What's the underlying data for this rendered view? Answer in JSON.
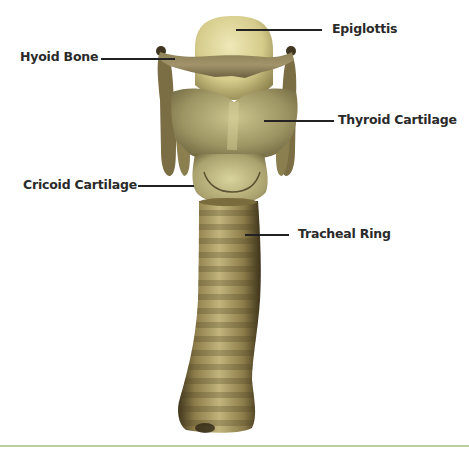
{
  "diagram": {
    "labels": [
      {
        "id": "epiglottis",
        "text": "Epiglottis"
      },
      {
        "id": "hyoid-bone",
        "text": "Hyoid Bone"
      },
      {
        "id": "thyroid-cartilage",
        "text": "Thyroid Cartilage"
      },
      {
        "id": "cricoid-cartilage",
        "text": "Cricoid Cartilage"
      },
      {
        "id": "tracheal-ring",
        "text": "Tracheal Ring"
      }
    ],
    "colors": {
      "background": "#ffffff",
      "label_text": "#2a2a2a",
      "leader_line": "#222222",
      "footer_rule": "#b9cf9c",
      "cartilage_light": "#e6e0a4",
      "cartilage_mid": "#a99d62",
      "cartilage_dark": "#5c5330"
    }
  }
}
